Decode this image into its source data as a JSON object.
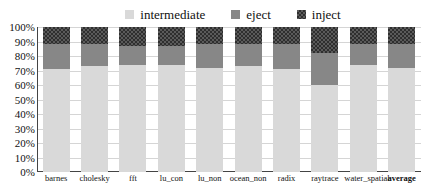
{
  "chart_data": {
    "type": "bar",
    "subtype": "stacked-bar-100-percent",
    "title": "",
    "subtitle": "",
    "xlabel": "",
    "ylabel": "",
    "ylim": [
      0,
      100
    ],
    "yticks": [
      "0%",
      "10%",
      "20%",
      "30%",
      "40%",
      "50%",
      "60%",
      "70%",
      "80%",
      "90%",
      "100%"
    ],
    "ytick_values": [
      0,
      10,
      20,
      30,
      40,
      50,
      60,
      70,
      80,
      90,
      100
    ],
    "grid": true,
    "legend_position": "top-center",
    "categories": [
      "barnes",
      "cholesky",
      "fft",
      "lu_con",
      "lu_non",
      "ocean_non",
      "radix",
      "raytrace",
      "water_spatial",
      "average"
    ],
    "highlight_category": "average",
    "series": [
      {
        "name": "intermediate",
        "color": "#d9d9d9",
        "values": [
          71,
          73,
          74,
          74,
          72,
          73,
          71,
          60,
          74,
          72
        ]
      },
      {
        "name": "eject",
        "color": "#878787",
        "values": [
          17,
          15,
          13,
          13,
          16,
          15,
          17,
          22,
          14,
          16
        ]
      },
      {
        "name": "inject",
        "color": "#3a3a3a",
        "values": [
          12,
          12,
          13,
          13,
          12,
          12,
          12,
          18,
          12,
          12
        ]
      }
    ]
  },
  "legend": {
    "items": [
      {
        "label": "intermediate",
        "swatch_class": "sw-intermediate"
      },
      {
        "label": "eject",
        "swatch_class": "sw-eject"
      },
      {
        "label": "inject",
        "swatch_class": "sw-inject"
      }
    ]
  },
  "colors": {
    "intermediate": "#d9d9d9",
    "eject": "#878787",
    "inject": "#3a3a3a",
    "axis": "#444444",
    "gridline": "#d5d5d5",
    "text": "#111111",
    "background": "#ffffff"
  }
}
